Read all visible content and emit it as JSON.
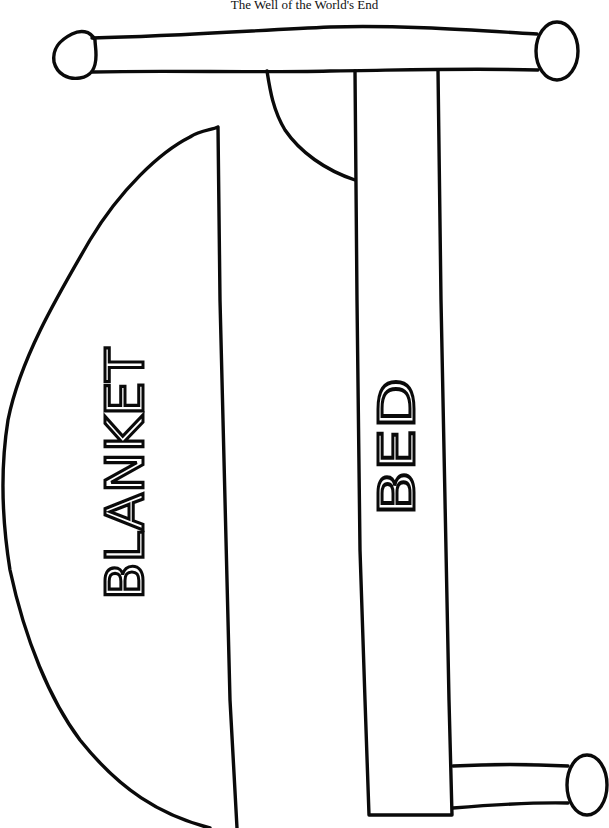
{
  "page": {
    "title": "The Well of the World's End"
  },
  "diagram": {
    "labels": {
      "blanket": "BLANKET",
      "bed": "BED"
    },
    "parts": [
      "headboard-bar",
      "headboard-knob-left",
      "headboard-knob-right",
      "pillow",
      "bed",
      "blanket",
      "footboard-bar",
      "footboard-knob"
    ],
    "colors": {
      "stroke": "#0a0a0a",
      "background": "#ffffff"
    }
  }
}
